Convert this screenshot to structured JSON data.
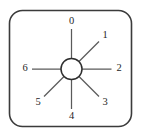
{
  "figure": {
    "name": "rotary-switch-position-diagram",
    "title": "",
    "panel": {
      "x": 9.5,
      "y": 10.5,
      "width": 122,
      "height": 116,
      "corner_radius": 13,
      "border_color": "#3b3b3b",
      "fill_color": "#ffffff"
    },
    "hub": {
      "center_x": 71.5,
      "center_y": 69,
      "radius": 10.5,
      "stroke_color": "#2e2e2e",
      "fill_color": "#ffffff"
    },
    "spoke_color": "#5a5a5a",
    "label_color": "#1f1f1f"
  },
  "chart_data": {
    "type": "scatter",
    "xlabel": "",
    "ylabel": "",
    "categories": [
      "0",
      "1",
      "2",
      "3",
      "4",
      "5",
      "6"
    ],
    "values": [
      0,
      45,
      90,
      135,
      180,
      225,
      270
    ],
    "series": [
      {
        "name": "switch-positions",
        "values": [
          0,
          45,
          90,
          135,
          180,
          225,
          270
        ]
      }
    ],
    "annotations": [
      "Spoke at 0 degrees (up) labelled 0",
      "Spoke at 45 degrees (upper right) labelled 1",
      "Spoke at 90 degrees (right) labelled 2",
      "Spoke at 135 degrees (lower right) labelled 3",
      "Spoke at 180 degrees (down) labelled 4",
      "Spoke at 225 degrees (lower left) labelled 5",
      "Spoke at 270 degrees (left) labelled 6",
      "No spoke at 315 degrees (upper left)"
    ],
    "grid": false,
    "legend": "none"
  },
  "positions": [
    {
      "label": "0",
      "angle_deg": 0,
      "spoke_end_x": 71.5,
      "spoke_end_y": 29,
      "label_x": 71.5,
      "label_y": 22
    },
    {
      "label": "1",
      "angle_deg": 45,
      "spoke_end_x": 99,
      "spoke_end_y": 41.5,
      "label_x": 105,
      "label_y": 35.5
    },
    {
      "label": "2",
      "angle_deg": 90,
      "spoke_end_x": 111.5,
      "spoke_end_y": 69,
      "label_x": 119,
      "label_y": 69
    },
    {
      "label": "3",
      "angle_deg": 135,
      "spoke_end_x": 99,
      "spoke_end_y": 96.5,
      "label_x": 105,
      "label_y": 102.5
    },
    {
      "label": "4",
      "angle_deg": 180,
      "spoke_end_x": 71.5,
      "spoke_end_y": 109,
      "label_x": 71.5,
      "label_y": 116.5
    },
    {
      "label": "5",
      "angle_deg": 225,
      "spoke_end_x": 44,
      "spoke_end_y": 96.5,
      "label_x": 38,
      "label_y": 102.5
    },
    {
      "label": "6",
      "angle_deg": 270,
      "spoke_end_x": 32,
      "spoke_end_y": 69,
      "label_x": 25,
      "label_y": 69
    }
  ]
}
